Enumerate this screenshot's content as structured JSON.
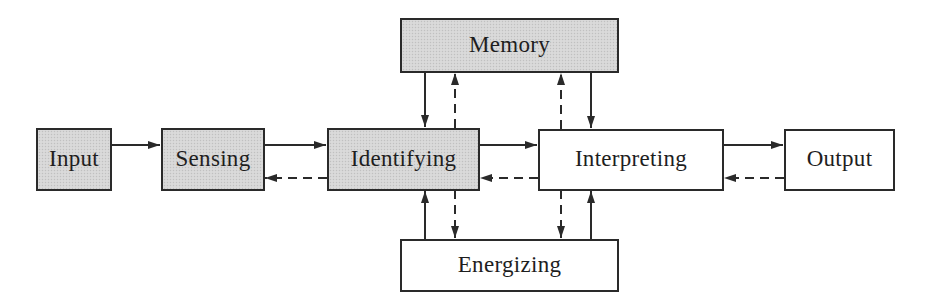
{
  "diagram": {
    "type": "block-flow",
    "nodes": [
      {
        "id": "input",
        "label": "Input",
        "shaded": true
      },
      {
        "id": "sensing",
        "label": "Sensing",
        "shaded": true
      },
      {
        "id": "identifying",
        "label": "Identifying",
        "shaded": true
      },
      {
        "id": "interpreting",
        "label": "Interpreting",
        "shaded": false
      },
      {
        "id": "output",
        "label": "Output",
        "shaded": false
      },
      {
        "id": "memory",
        "label": "Memory",
        "shaded": true
      },
      {
        "id": "energizing",
        "label": "Energizing",
        "shaded": false
      }
    ],
    "edges": [
      {
        "from": "input",
        "to": "sensing",
        "style": "solid"
      },
      {
        "from": "sensing",
        "to": "identifying",
        "style": "solid"
      },
      {
        "from": "identifying",
        "to": "sensing",
        "style": "dashed"
      },
      {
        "from": "identifying",
        "to": "interpreting",
        "style": "solid"
      },
      {
        "from": "interpreting",
        "to": "identifying",
        "style": "dashed"
      },
      {
        "from": "interpreting",
        "to": "output",
        "style": "solid"
      },
      {
        "from": "output",
        "to": "interpreting",
        "style": "dashed"
      },
      {
        "from": "memory",
        "to": "identifying",
        "style": "solid"
      },
      {
        "from": "identifying",
        "to": "memory",
        "style": "dashed"
      },
      {
        "from": "interpreting",
        "to": "memory",
        "style": "dashed"
      },
      {
        "from": "memory",
        "to": "interpreting",
        "style": "solid"
      },
      {
        "from": "energizing",
        "to": "identifying",
        "style": "solid"
      },
      {
        "from": "identifying",
        "to": "energizing",
        "style": "dashed"
      },
      {
        "from": "interpreting",
        "to": "energizing",
        "style": "dashed"
      },
      {
        "from": "energizing",
        "to": "interpreting",
        "style": "solid"
      }
    ]
  },
  "colors": {
    "shaded_fill": "#d6d6d6",
    "plain_fill": "#ffffff",
    "stroke": "#2a2a2a"
  }
}
